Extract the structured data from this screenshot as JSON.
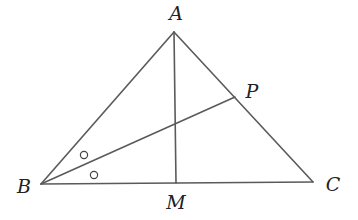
{
  "diagram": {
    "type": "geometry",
    "points": {
      "A": {
        "label": "A",
        "x": 174,
        "y": 32,
        "label_x": 176,
        "label_y": 20
      },
      "B": {
        "label": "B",
        "x": 41,
        "y": 184,
        "label_x": 24,
        "label_y": 193
      },
      "C": {
        "label": "C",
        "x": 313,
        "y": 182,
        "label_x": 333,
        "label_y": 191
      },
      "M": {
        "label": "M",
        "x": 176,
        "y": 183,
        "label_x": 176,
        "label_y": 209
      },
      "P": {
        "label": "P",
        "x": 235,
        "y": 97,
        "label_x": 252,
        "label_y": 98
      }
    },
    "segments": [
      {
        "from": "A",
        "to": "B"
      },
      {
        "from": "B",
        "to": "C"
      },
      {
        "from": "A",
        "to": "C"
      },
      {
        "from": "A",
        "to": "M"
      },
      {
        "from": "B",
        "to": "P"
      }
    ],
    "angle_marks": [
      {
        "vertex": "B",
        "between": [
          "A",
          "P"
        ],
        "symbol": "circle",
        "x": 84,
        "y": 155
      },
      {
        "vertex": "B",
        "between": [
          "P",
          "C"
        ],
        "symbol": "circle",
        "x": 94,
        "y": 175
      }
    ],
    "colors": {
      "line": "#5a5a5a",
      "text": "#222222",
      "background": "#ffffff"
    }
  }
}
